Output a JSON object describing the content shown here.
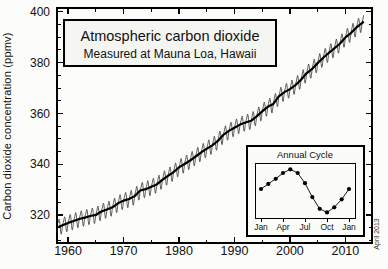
{
  "chart_data": [
    {
      "type": "line",
      "title": "Atmospheric carbon dioxide",
      "subtitle": "Measured at Mauna Loa, Hawaii",
      "xlabel": "",
      "ylabel": "Carbon dioxide concentration (ppmv)",
      "date_note": "April 2013",
      "xlim": [
        1958,
        2014.8
      ],
      "ylim": [
        309,
        401.5
      ],
      "x_major_ticks": [
        1960,
        1970,
        1980,
        1990,
        2000,
        2010
      ],
      "x_minor_tick_step": 5,
      "y_major_ticks": [
        320,
        340,
        360,
        380,
        400
      ],
      "y_minor_tick_step": 5,
      "grid": false,
      "series": [
        {
          "name": "annual trend (thick black line)",
          "x": [
            1958.25,
            1959,
            1960,
            1961,
            1962,
            1963,
            1964,
            1965,
            1966,
            1967,
            1968,
            1969,
            1970,
            1971,
            1972,
            1973,
            1974,
            1975,
            1976,
            1977,
            1978,
            1979,
            1980,
            1981,
            1982,
            1983,
            1984,
            1985,
            1986,
            1987,
            1988,
            1989,
            1990,
            1991,
            1992,
            1993,
            1994,
            1995,
            1996,
            1997,
            1998,
            1999,
            2000,
            2001,
            2002,
            2003,
            2004,
            2005,
            2006,
            2007,
            2008,
            2009,
            2010,
            2011,
            2012,
            2013,
            2013.3
          ],
          "values": [
            315.3,
            315.97,
            316.91,
            317.64,
            318.45,
            318.99,
            319.62,
            320.04,
            321.38,
            322.16,
            323.04,
            324.62,
            325.68,
            326.32,
            327.45,
            329.68,
            330.18,
            331.11,
            332.04,
            333.83,
            335.4,
            336.84,
            338.75,
            340.11,
            341.45,
            343.05,
            344.65,
            346.12,
            347.42,
            349.19,
            351.57,
            353.12,
            354.39,
            355.61,
            356.45,
            357.1,
            358.83,
            360.82,
            362.61,
            363.73,
            366.7,
            368.38,
            369.55,
            371.14,
            373.28,
            375.8,
            377.52,
            379.8,
            381.9,
            383.79,
            385.6,
            387.43,
            389.9,
            391.65,
            393.85,
            395.5,
            396.2
          ]
        },
        {
          "name": "monthly mean (thin oscillating line)",
          "construction": "trend value plus seasonal deviation for each month",
          "seasonal_deviation_ppm": [
            0.3,
            1.0,
            1.6,
            2.5,
            3.0,
            2.3,
            0.7,
            -1.5,
            -3.1,
            -3.3,
            -2.1,
            -0.8
          ]
        }
      ]
    },
    {
      "type": "line",
      "title": "Annual Cycle",
      "x_tick_labels": [
        "Jan",
        "Apr",
        "Jul",
        "Oct",
        "Jan"
      ],
      "months": [
        "Jan",
        "Feb",
        "Mar",
        "Apr",
        "May",
        "Jun",
        "Jul",
        "Aug",
        "Sep",
        "Oct",
        "Nov",
        "Dec",
        "Jan"
      ],
      "values_ppm_deviation": [
        0.2,
        0.9,
        1.6,
        2.4,
        2.9,
        2.4,
        1.0,
        -0.9,
        -2.5,
        -3.0,
        -2.3,
        -1.2,
        0.2
      ]
    }
  ],
  "colors": {
    "axis": "#000000",
    "monthly_line": "#4d4d4d",
    "trend_line": "#000000",
    "title_box_fill": "#f5f5f2",
    "inset_fill": "#fbfbf8",
    "background": "#fcfcfa",
    "text": "#111111"
  }
}
